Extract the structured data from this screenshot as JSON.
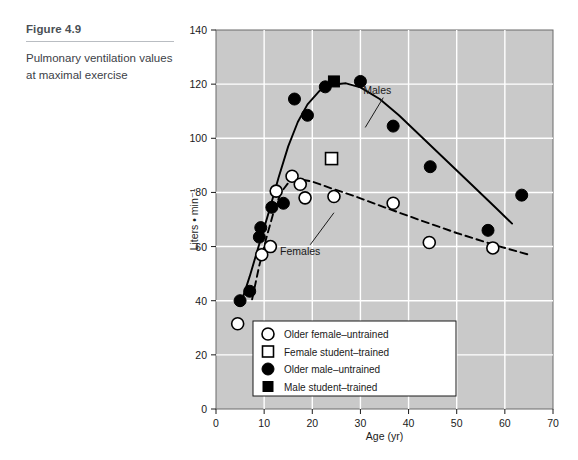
{
  "caption": {
    "figure_number": "Figure 4.9",
    "description": "Pulmonary ventilation values at maximal exercise"
  },
  "chart_data": {
    "type": "scatter",
    "title": "Pulmonary ventilation values at maximal exercise",
    "xlabel": "Age (yr)",
    "ylabel": "Liters • min⁻¹",
    "xlim": [
      0,
      70
    ],
    "ylim": [
      0,
      140
    ],
    "xticks": [
      0,
      10,
      20,
      30,
      40,
      50,
      60,
      70
    ],
    "yticks": [
      0,
      20,
      40,
      60,
      80,
      100,
      120,
      140
    ],
    "grid": true,
    "plot_background": "#c9c9c9",
    "gridline_color": "#ffffff",
    "legend_position": "inside-bottom-center",
    "legend": [
      {
        "marker": "open-circle",
        "label": "Older female–untrained"
      },
      {
        "marker": "open-square",
        "label": "Female student–trained"
      },
      {
        "marker": "filled-circle",
        "label": "Older male–untrained"
      },
      {
        "marker": "filled-square",
        "label": "Male student–trained"
      }
    ],
    "annotations": [
      {
        "text": "Males",
        "x": 33.5,
        "y": 116.5,
        "leader_to": {
          "x": 31.0,
          "y": 104.0
        }
      },
      {
        "text": "Females",
        "x": 17.5,
        "y": 57.0,
        "leader_to": {
          "x": 24.5,
          "y": 72.5
        }
      }
    ],
    "series": [
      {
        "name": "Older male–untrained",
        "marker": "filled-circle",
        "color": "#000000",
        "points": [
          {
            "x": 5.0,
            "y": 40.0
          },
          {
            "x": 7.0,
            "y": 43.5
          },
          {
            "x": 9.0,
            "y": 63.5
          },
          {
            "x": 9.3,
            "y": 67.0
          },
          {
            "x": 11.6,
            "y": 74.5
          },
          {
            "x": 14.0,
            "y": 76.0
          },
          {
            "x": 16.3,
            "y": 114.5
          },
          {
            "x": 19.0,
            "y": 108.5
          },
          {
            "x": 22.7,
            "y": 119.0
          },
          {
            "x": 30.0,
            "y": 121.0
          },
          {
            "x": 36.8,
            "y": 104.5
          },
          {
            "x": 44.5,
            "y": 89.5
          },
          {
            "x": 56.5,
            "y": 66.0
          },
          {
            "x": 63.5,
            "y": 79.0
          }
        ]
      },
      {
        "name": "Older female–untrained",
        "marker": "open-circle",
        "color": "#ffffff",
        "points": [
          {
            "x": 4.5,
            "y": 31.5
          },
          {
            "x": 9.5,
            "y": 57.0
          },
          {
            "x": 11.3,
            "y": 60.0
          },
          {
            "x": 12.5,
            "y": 80.5
          },
          {
            "x": 15.8,
            "y": 86.0
          },
          {
            "x": 17.5,
            "y": 83.0
          },
          {
            "x": 18.5,
            "y": 78.0
          },
          {
            "x": 24.5,
            "y": 78.5
          },
          {
            "x": 36.8,
            "y": 76.0
          },
          {
            "x": 44.3,
            "y": 61.5
          },
          {
            "x": 57.5,
            "y": 59.5
          }
        ]
      },
      {
        "name": "Male student–trained",
        "marker": "filled-square",
        "color": "#000000",
        "points": [
          {
            "x": 24.5,
            "y": 121.0
          }
        ]
      },
      {
        "name": "Female student–trained",
        "marker": "open-square",
        "color": "#ffffff",
        "points": [
          {
            "x": 24.0,
            "y": 92.5
          }
        ]
      }
    ],
    "fitted_curves": [
      {
        "name": "Males",
        "style": "solid",
        "color": "#000000",
        "points": [
          {
            "x": 5.0,
            "y": 38.0
          },
          {
            "x": 7.0,
            "y": 49.0
          },
          {
            "x": 9.0,
            "y": 61.0
          },
          {
            "x": 11.0,
            "y": 73.0
          },
          {
            "x": 13.0,
            "y": 85.5
          },
          {
            "x": 15.0,
            "y": 97.0
          },
          {
            "x": 17.0,
            "y": 106.0
          },
          {
            "x": 19.0,
            "y": 112.5
          },
          {
            "x": 21.5,
            "y": 117.5
          },
          {
            "x": 24.0,
            "y": 119.8
          },
          {
            "x": 27.0,
            "y": 120.3
          },
          {
            "x": 30.0,
            "y": 118.8
          },
          {
            "x": 34.0,
            "y": 114.5
          },
          {
            "x": 38.0,
            "y": 108.5
          },
          {
            "x": 43.0,
            "y": 100.0
          },
          {
            "x": 48.0,
            "y": 91.5
          },
          {
            "x": 53.0,
            "y": 83.0
          },
          {
            "x": 58.0,
            "y": 74.5
          },
          {
            "x": 61.5,
            "y": 68.5
          }
        ]
      },
      {
        "name": "Females",
        "style": "dashed",
        "color": "#000000",
        "points": [
          {
            "x": 7.5,
            "y": 40.5
          },
          {
            "x": 9.0,
            "y": 53.0
          },
          {
            "x": 10.5,
            "y": 63.5
          },
          {
            "x": 12.0,
            "y": 73.0
          },
          {
            "x": 13.5,
            "y": 80.0
          },
          {
            "x": 15.0,
            "y": 83.5
          },
          {
            "x": 17.0,
            "y": 85.0
          },
          {
            "x": 20.0,
            "y": 84.0
          },
          {
            "x": 24.0,
            "y": 81.5
          },
          {
            "x": 29.0,
            "y": 78.5
          },
          {
            "x": 35.0,
            "y": 74.5
          },
          {
            "x": 42.0,
            "y": 70.0
          },
          {
            "x": 50.0,
            "y": 65.0
          },
          {
            "x": 58.0,
            "y": 60.5
          },
          {
            "x": 65.0,
            "y": 57.0
          }
        ]
      }
    ]
  }
}
